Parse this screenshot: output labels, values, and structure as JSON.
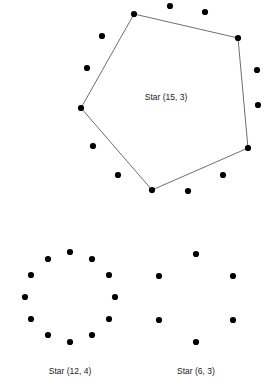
{
  "page": {
    "background_color": "#ffffff",
    "width": 271,
    "height": 388
  },
  "style": {
    "node_color": "#000000",
    "node_radius": 3.1,
    "edge_color": "#4a4a4a",
    "edge_width": 0.8,
    "label_color": "#1a1a1a",
    "label_font_size": 8.5
  },
  "chart_data": {
    "type": "scatter",
    "title": "",
    "xlabel": "",
    "ylabel": "",
    "grid": false,
    "legend": "none",
    "figures": [
      {
        "id": "star-15-3",
        "label": "Star (15, 3)",
        "n": 15,
        "k": 3,
        "label_position": {
          "x": 166,
          "y": 98
        },
        "center": {
          "x": 167,
          "y": 99
        },
        "radius": 92,
        "nodes": [
          {
            "x": 134,
            "y": 14,
            "vertex": true
          },
          {
            "x": 170,
            "y": 6,
            "vertex": false
          },
          {
            "x": 205,
            "y": 12,
            "vertex": false
          },
          {
            "x": 238,
            "y": 38,
            "vertex": true
          },
          {
            "x": 257,
            "y": 70,
            "vertex": false
          },
          {
            "x": 258,
            "y": 105,
            "vertex": false
          },
          {
            "x": 248,
            "y": 148,
            "vertex": true
          },
          {
            "x": 223,
            "y": 175,
            "vertex": false
          },
          {
            "x": 188,
            "y": 191,
            "vertex": false
          },
          {
            "x": 152,
            "y": 190,
            "vertex": true
          },
          {
            "x": 118,
            "y": 175,
            "vertex": false
          },
          {
            "x": 93,
            "y": 146,
            "vertex": false
          },
          {
            "x": 81,
            "y": 108,
            "vertex": true
          },
          {
            "x": 87,
            "y": 68,
            "vertex": false
          },
          {
            "x": 102,
            "y": 36,
            "vertex": false
          }
        ],
        "edges": [
          {
            "from": {
              "x": 134,
              "y": 14
            },
            "to": {
              "x": 238,
              "y": 38
            }
          },
          {
            "from": {
              "x": 238,
              "y": 38
            },
            "to": {
              "x": 248,
              "y": 148
            }
          },
          {
            "from": {
              "x": 248,
              "y": 148
            },
            "to": {
              "x": 152,
              "y": 190
            }
          },
          {
            "from": {
              "x": 152,
              "y": 190
            },
            "to": {
              "x": 81,
              "y": 108
            }
          },
          {
            "from": {
              "x": 81,
              "y": 108
            },
            "to": {
              "x": 134,
              "y": 14
            }
          }
        ]
      },
      {
        "id": "star-12-4",
        "label": "Star (12, 4)",
        "n": 12,
        "k": 4,
        "label_position": {
          "x": 70,
          "y": 372
        },
        "center": {
          "x": 70,
          "y": 297
        },
        "radius": 45,
        "nodes": [
          {
            "x": 70,
            "y": 252,
            "vertex": false
          },
          {
            "x": 92,
            "y": 259,
            "vertex": false
          },
          {
            "x": 109,
            "y": 275,
            "vertex": false
          },
          {
            "x": 115,
            "y": 297,
            "vertex": false
          },
          {
            "x": 109,
            "y": 319,
            "vertex": false
          },
          {
            "x": 92,
            "y": 335,
            "vertex": false
          },
          {
            "x": 70,
            "y": 342,
            "vertex": false
          },
          {
            "x": 48,
            "y": 335,
            "vertex": false
          },
          {
            "x": 31,
            "y": 319,
            "vertex": false
          },
          {
            "x": 25,
            "y": 297,
            "vertex": false
          },
          {
            "x": 31,
            "y": 275,
            "vertex": false
          },
          {
            "x": 48,
            "y": 259,
            "vertex": false
          }
        ],
        "edges": []
      },
      {
        "id": "star-6-3",
        "label": "Star (6, 3)",
        "n": 6,
        "k": 3,
        "label_position": {
          "x": 196,
          "y": 372
        },
        "center": {
          "x": 196,
          "y": 297
        },
        "radius": 45,
        "nodes": [
          {
            "x": 196,
            "y": 254,
            "vertex": false
          },
          {
            "x": 233,
            "y": 276,
            "vertex": false
          },
          {
            "x": 233,
            "y": 320,
            "vertex": false
          },
          {
            "x": 196,
            "y": 342,
            "vertex": false
          },
          {
            "x": 159,
            "y": 320,
            "vertex": false
          },
          {
            "x": 159,
            "y": 276,
            "vertex": false
          }
        ],
        "edges": []
      }
    ]
  }
}
